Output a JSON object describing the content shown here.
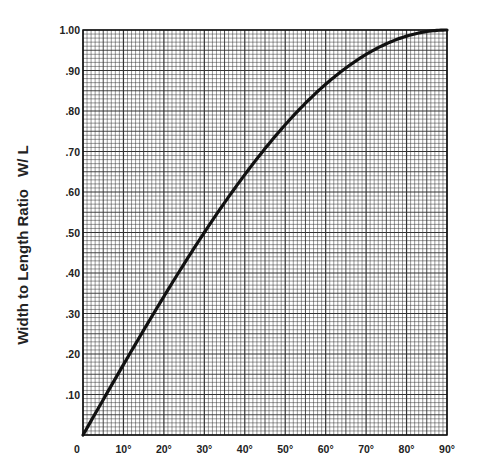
{
  "chart_data": {
    "type": "line",
    "title": "",
    "xlabel": "",
    "ylabel": "Width to Length Ratio",
    "ylabel_suffix": "W/ L",
    "x_ticks": [
      "0",
      "10°",
      "20°",
      "30°",
      "40°",
      "50°",
      "60°",
      "70°",
      "80°",
      "90°"
    ],
    "y_ticks": [
      ".10",
      ".20",
      ".30",
      ".40",
      ".50",
      ".60",
      ".70",
      ".80",
      ".90",
      "1.00"
    ],
    "xlim": [
      0,
      90
    ],
    "ylim": [
      0,
      1.0
    ],
    "grid": true,
    "grid_minor_x_step": 1,
    "grid_minor_y_step": 0.01,
    "series": [
      {
        "name": "W/L = sin(angle)",
        "x": [
          0,
          5,
          10,
          15,
          20,
          25,
          30,
          35,
          40,
          45,
          50,
          55,
          60,
          65,
          70,
          75,
          80,
          85,
          90
        ],
        "values": [
          0.0,
          0.087,
          0.174,
          0.259,
          0.342,
          0.423,
          0.5,
          0.574,
          0.643,
          0.707,
          0.766,
          0.819,
          0.866,
          0.906,
          0.94,
          0.966,
          0.985,
          0.996,
          1.0
        ]
      }
    ]
  },
  "colors": {
    "grid": "#333333",
    "curve": "#111111",
    "background": "#ffffff"
  }
}
